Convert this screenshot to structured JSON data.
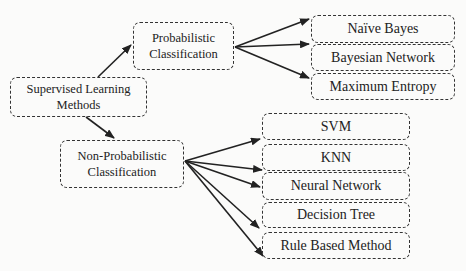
{
  "diagram": {
    "root": {
      "label_line1": "Supervised Learning",
      "label_line2": "Methods"
    },
    "probabilistic": {
      "label_line1": "Probabilistic",
      "label_line2": "Classification",
      "children": [
        "Naïve Bayes",
        "Bayesian Network",
        "Maximum Entropy"
      ]
    },
    "non_probabilistic": {
      "label_line1": "Non-Probabilistic",
      "label_line2": "Classification",
      "children": [
        "SVM",
        "KNN",
        "Neural Network",
        "Decision Tree",
        "Rule Based Method"
      ]
    },
    "colors": {
      "stroke": "#333333",
      "background": "#fbfbfa",
      "text": "#222222"
    },
    "edges": [
      {
        "from": "Supervised Learning Methods",
        "to": "Probabilistic Classification"
      },
      {
        "from": "Supervised Learning Methods",
        "to": "Non-Probabilistic Classification"
      },
      {
        "from": "Probabilistic Classification",
        "to": "Naïve Bayes"
      },
      {
        "from": "Probabilistic Classification",
        "to": "Bayesian Network"
      },
      {
        "from": "Probabilistic Classification",
        "to": "Maximum Entropy"
      },
      {
        "from": "Non-Probabilistic Classification",
        "to": "SVM"
      },
      {
        "from": "Non-Probabilistic Classification",
        "to": "KNN"
      },
      {
        "from": "Non-Probabilistic Classification",
        "to": "Neural Network"
      },
      {
        "from": "Non-Probabilistic Classification",
        "to": "Decision Tree"
      },
      {
        "from": "Non-Probabilistic Classification",
        "to": "Rule Based Method"
      }
    ]
  }
}
